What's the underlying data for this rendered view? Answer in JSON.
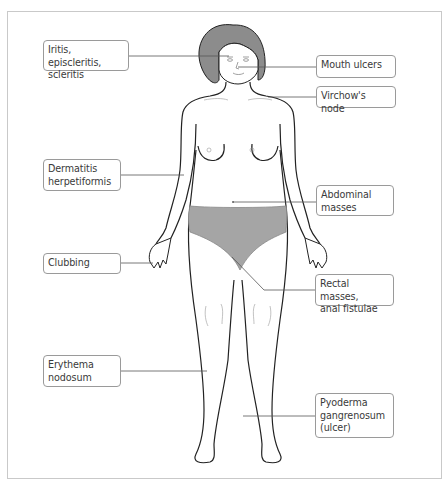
{
  "diagram": {
    "colors": {
      "hair": "#8c8c8c",
      "underwear": "#a5a5a5",
      "outline": "#222222",
      "leader": "#555555",
      "box_border": "#9a9a9a",
      "frame": "#c9c9c9"
    },
    "labels": {
      "iritis": "Iritis, episcleritis,\nscleritis",
      "mouth": "Mouth ulcers",
      "virchow": "Virchow's node",
      "dermatitis": "Dermatitis\nherpetiformis",
      "abdominal": "Abdominal\nmasses",
      "clubbing": "Clubbing",
      "rectal": "Rectal masses,\nanal fistulae",
      "erythema": "Erythema\nnodosum",
      "pyoderma": "Pyoderma\ngangrenosum\n(ulcer)"
    }
  }
}
